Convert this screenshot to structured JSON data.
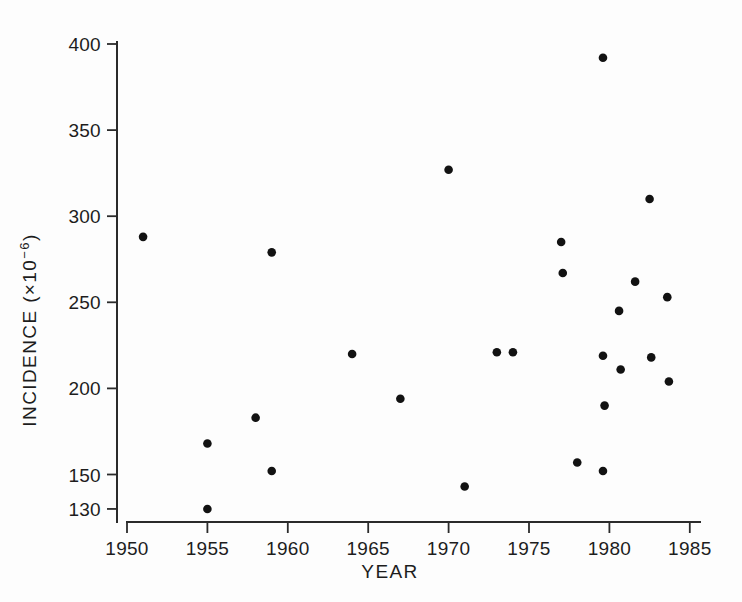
{
  "chart_data": {
    "type": "scatter",
    "title": "",
    "xlabel": "YEAR",
    "ylabel": "INCIDENCE (×10⁻⁶)",
    "ylabel_parts": {
      "main": "INCIDENCE (×10",
      "exponent": "−6",
      "close": ")"
    },
    "xlim": [
      1949.0,
      1985.6
    ],
    "ylim": [
      122,
      400
    ],
    "grid": false,
    "legend": null,
    "xticks": [
      1950,
      1955,
      1960,
      1965,
      1970,
      1975,
      1980,
      1985
    ],
    "xtick_labels": [
      "1950",
      "1955",
      "1960",
      "1965",
      "1970",
      "1975",
      "1980",
      "1985"
    ],
    "yticks": [
      130,
      150,
      200,
      250,
      300,
      350,
      400
    ],
    "ytick_labels": [
      "130",
      "150",
      "200",
      "250",
      "300",
      "350",
      "400"
    ],
    "marker": "filled-circle",
    "marker_color": "#121212",
    "marker_size": 7,
    "points": [
      {
        "x": 1951.0,
        "y": 288
      },
      {
        "x": 1955.0,
        "y": 168
      },
      {
        "x": 1955.0,
        "y": 130
      },
      {
        "x": 1958.0,
        "y": 183
      },
      {
        "x": 1959.0,
        "y": 279
      },
      {
        "x": 1959.0,
        "y": 152
      },
      {
        "x": 1964.0,
        "y": 220
      },
      {
        "x": 1967.0,
        "y": 194
      },
      {
        "x": 1970.0,
        "y": 327
      },
      {
        "x": 1971.0,
        "y": 143
      },
      {
        "x": 1973.0,
        "y": 221
      },
      {
        "x": 1974.0,
        "y": 221
      },
      {
        "x": 1977.0,
        "y": 285
      },
      {
        "x": 1977.1,
        "y": 267
      },
      {
        "x": 1978.0,
        "y": 157
      },
      {
        "x": 1979.6,
        "y": 392
      },
      {
        "x": 1979.6,
        "y": 219
      },
      {
        "x": 1979.7,
        "y": 190
      },
      {
        "x": 1979.6,
        "y": 152
      },
      {
        "x": 1980.6,
        "y": 245
      },
      {
        "x": 1980.7,
        "y": 211
      },
      {
        "x": 1981.6,
        "y": 262
      },
      {
        "x": 1982.5,
        "y": 310
      },
      {
        "x": 1982.6,
        "y": 218
      },
      {
        "x": 1983.6,
        "y": 253
      },
      {
        "x": 1983.7,
        "y": 204
      }
    ]
  },
  "axes": {
    "x_title": "YEAR",
    "y_title": "INCIDENCE (×10⁻⁶)"
  },
  "colors": {
    "marker": "#121212",
    "axis": "#2b2b2b",
    "background": "#fdfdfd"
  }
}
